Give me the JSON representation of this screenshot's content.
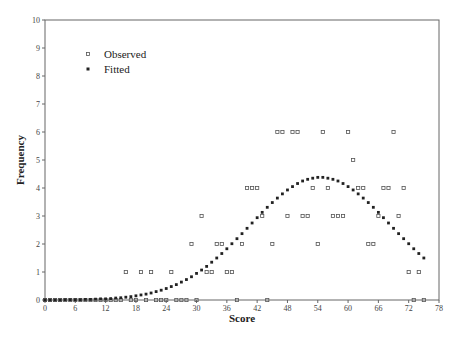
{
  "chart_data": {
    "type": "scatter",
    "title": "",
    "xlabel": "Score",
    "ylabel": "Frequency",
    "xlim": [
      0,
      78
    ],
    "ylim": [
      0,
      10
    ],
    "x_ticks": [
      0,
      6,
      12,
      18,
      24,
      30,
      36,
      42,
      48,
      54,
      60,
      66,
      72,
      78
    ],
    "y_ticks": [
      0,
      1,
      2,
      3,
      4,
      5,
      6,
      7,
      8,
      9,
      10
    ],
    "grid": false,
    "legend": {
      "position": "upper-left",
      "entries": [
        "Observed",
        "Fitted"
      ]
    },
    "series": [
      {
        "name": "Observed",
        "marker": "hollow-square",
        "x": [
          0,
          1,
          2,
          3,
          4,
          5,
          6,
          7,
          8,
          9,
          10,
          11,
          12,
          13,
          14,
          15,
          16,
          17,
          18,
          19,
          20,
          21,
          22,
          23,
          24,
          25,
          26,
          27,
          28,
          29,
          30,
          31,
          32,
          33,
          34,
          35,
          36,
          37,
          38,
          39,
          40,
          41,
          42,
          43,
          44,
          45,
          46,
          47,
          48,
          49,
          50,
          51,
          52,
          53,
          54,
          55,
          56,
          57,
          58,
          59,
          60,
          61,
          62,
          63,
          64,
          65,
          66,
          67,
          68,
          69,
          70,
          71,
          72,
          73,
          74,
          75
        ],
        "y": [
          0,
          0,
          0,
          0,
          0,
          0,
          0,
          0,
          0,
          0,
          0,
          0,
          0,
          0,
          0,
          0,
          1,
          0,
          0,
          1,
          0,
          1,
          0,
          0,
          0,
          1,
          0,
          0,
          0,
          2,
          0,
          3,
          1,
          1,
          2,
          2,
          1,
          1,
          0,
          2,
          4,
          4,
          4,
          3,
          0,
          2,
          6,
          6,
          3,
          6,
          6,
          3,
          3,
          4,
          2,
          6,
          4,
          3,
          3,
          3,
          6,
          5,
          4,
          4,
          2,
          2,
          3,
          4,
          4,
          6,
          3,
          4,
          1,
          0,
          1,
          0
        ]
      },
      {
        "name": "Fitted",
        "marker": "filled-square",
        "x": [
          0,
          1,
          2,
          3,
          4,
          5,
          6,
          7,
          8,
          9,
          10,
          11,
          12,
          13,
          14,
          15,
          16,
          17,
          18,
          19,
          20,
          21,
          22,
          23,
          24,
          25,
          26,
          27,
          28,
          29,
          30,
          31,
          32,
          33,
          34,
          35,
          36,
          37,
          38,
          39,
          40,
          41,
          42,
          43,
          44,
          45,
          46,
          47,
          48,
          49,
          50,
          51,
          52,
          53,
          54,
          55,
          56,
          57,
          58,
          59,
          60,
          61,
          62,
          63,
          64,
          65,
          66,
          67,
          68,
          69,
          70,
          71,
          72,
          73,
          74,
          75
        ],
        "y": [
          0.0,
          0.0,
          0.0,
          0.0,
          0.01,
          0.01,
          0.01,
          0.01,
          0.02,
          0.02,
          0.03,
          0.04,
          0.04,
          0.05,
          0.07,
          0.08,
          0.1,
          0.12,
          0.15,
          0.18,
          0.21,
          0.25,
          0.3,
          0.35,
          0.41,
          0.48,
          0.55,
          0.64,
          0.73,
          0.83,
          0.95,
          1.07,
          1.2,
          1.35,
          1.5,
          1.66,
          1.83,
          2.01,
          2.19,
          2.37,
          2.56,
          2.75,
          2.94,
          3.13,
          3.31,
          3.48,
          3.64,
          3.79,
          3.93,
          4.05,
          4.16,
          4.25,
          4.31,
          4.35,
          4.38,
          4.38,
          4.35,
          4.31,
          4.25,
          4.16,
          4.05,
          3.93,
          3.79,
          3.64,
          3.48,
          3.31,
          3.13,
          2.94,
          2.75,
          2.56,
          2.37,
          2.19,
          2.01,
          1.83,
          1.66,
          1.5
        ]
      }
    ]
  },
  "colors": {
    "axis": "#666666",
    "observed_marker": "#555555",
    "fitted_marker": "#222222",
    "background": "#ffffff"
  }
}
